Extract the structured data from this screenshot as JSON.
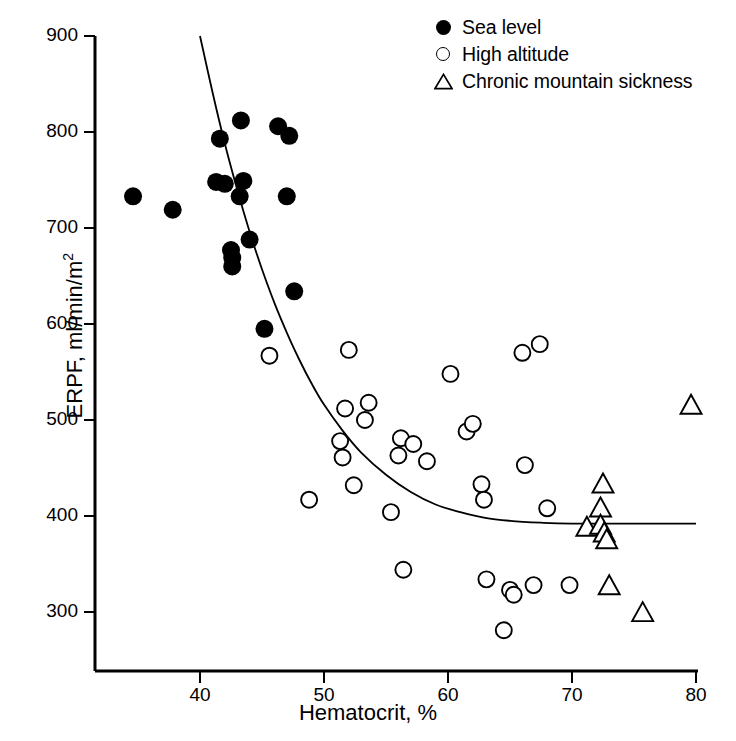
{
  "chart_data": {
    "type": "scatter",
    "title": "",
    "xlabel": "Hematocrit, %",
    "ylabel": "ERPF, ml/min/m2",
    "ylabel_main": "ERPF, ml/min/m",
    "ylabel_sup": "2",
    "xlim": [
      32.2,
      80
    ],
    "ylim": [
      270,
      900
    ],
    "xticks": [
      40,
      50,
      60,
      70,
      80
    ],
    "yticks": [
      300,
      400,
      500,
      600,
      700,
      800,
      900
    ],
    "grid": false,
    "legend_position": "top-right",
    "series": [
      {
        "name": "Sea level",
        "marker": "filled-circle",
        "color": "#000000",
        "points": [
          [
            34.6,
            733
          ],
          [
            37.8,
            719
          ],
          [
            41.3,
            748
          ],
          [
            41.6,
            793
          ],
          [
            42.0,
            746
          ],
          [
            42.5,
            677
          ],
          [
            42.6,
            660
          ],
          [
            42.6,
            669
          ],
          [
            43.2,
            733
          ],
          [
            43.3,
            812
          ],
          [
            43.5,
            749
          ],
          [
            44.0,
            688
          ],
          [
            45.2,
            595
          ],
          [
            46.3,
            806
          ],
          [
            47.0,
            733
          ],
          [
            47.2,
            796
          ],
          [
            47.6,
            634
          ]
        ]
      },
      {
        "name": "High altitude",
        "marker": "open-circle",
        "color": "#000000",
        "points": [
          [
            45.6,
            567
          ],
          [
            48.8,
            417
          ],
          [
            51.3,
            478
          ],
          [
            51.5,
            461
          ],
          [
            51.7,
            512
          ],
          [
            52.0,
            573
          ],
          [
            52.4,
            432
          ],
          [
            53.3,
            500
          ],
          [
            53.6,
            518
          ],
          [
            55.4,
            404
          ],
          [
            56.0,
            463
          ],
          [
            56.2,
            481
          ],
          [
            56.4,
            344
          ],
          [
            57.2,
            475
          ],
          [
            58.3,
            457
          ],
          [
            60.2,
            548
          ],
          [
            61.5,
            488
          ],
          [
            62.0,
            496
          ],
          [
            62.7,
            433
          ],
          [
            62.9,
            417
          ],
          [
            63.1,
            334
          ],
          [
            64.5,
            281
          ],
          [
            65.0,
            323
          ],
          [
            65.3,
            318
          ],
          [
            66.0,
            570
          ],
          [
            66.2,
            453
          ],
          [
            66.9,
            328
          ],
          [
            67.4,
            579
          ],
          [
            68.0,
            408
          ],
          [
            69.8,
            328
          ]
        ]
      },
      {
        "name": "Chronic mountain sickness",
        "marker": "open-triangle",
        "color": "#000000",
        "points": [
          [
            71.2,
            387
          ],
          [
            72.3,
            407
          ],
          [
            72.3,
            389
          ],
          [
            72.5,
            432
          ],
          [
            72.6,
            381
          ],
          [
            72.8,
            374
          ],
          [
            73.0,
            326
          ],
          [
            75.7,
            298
          ],
          [
            79.6,
            514
          ]
        ]
      }
    ],
    "fit_curve": {
      "description": "decaying exponential fit through sea level, high altitude and CMS data",
      "points": [
        [
          40.0,
          900
        ],
        [
          41.0,
          842
        ],
        [
          42.0,
          788
        ],
        [
          43.0,
          740
        ],
        [
          44.0,
          696
        ],
        [
          45.0,
          657
        ],
        [
          46.0,
          622
        ],
        [
          47.0,
          591
        ],
        [
          48.0,
          563
        ],
        [
          49.0,
          538
        ],
        [
          50.0,
          516
        ],
        [
          51.5,
          489
        ],
        [
          53.0,
          466
        ],
        [
          55.0,
          443
        ],
        [
          57.0,
          425
        ],
        [
          59.0,
          412
        ],
        [
          61.0,
          404
        ],
        [
          63.0,
          398
        ],
        [
          65.0,
          395
        ],
        [
          67.5,
          393
        ],
        [
          70.0,
          392
        ],
        [
          75.0,
          392
        ],
        [
          80.0,
          392
        ]
      ]
    }
  },
  "legend": {
    "items": [
      {
        "label": "Sea level",
        "marker": "filled-circle"
      },
      {
        "label": "High altitude",
        "marker": "open-circle"
      },
      {
        "label": "Chronic mountain sickness",
        "marker": "open-triangle"
      }
    ]
  },
  "axes": {
    "x_tick_labels": [
      "40",
      "50",
      "60",
      "70",
      "80"
    ],
    "y_tick_labels": [
      "300",
      "400",
      "500",
      "600",
      "700",
      "800",
      "900"
    ],
    "x_title": "Hematocrit, %",
    "y_title_main": "ERPF, ml/min/m",
    "y_title_sup": "2"
  }
}
